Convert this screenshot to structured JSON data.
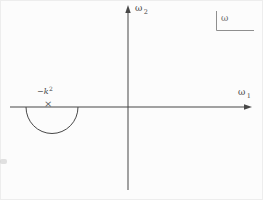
{
  "diagram": {
    "background_color": "#fcfcfc",
    "line_color": "#474747",
    "bracket_color": "#8f8f8f",
    "vertical_axis_label": {
      "symbol": "ω",
      "subscript": "2"
    },
    "horizontal_axis_label": {
      "symbol": "ω",
      "subscript": "1"
    },
    "plane_label": "ω",
    "pole": {
      "label_prefix": "−",
      "label_symbol": "k",
      "label_exponent": "2",
      "marker_symbol": "×"
    }
  }
}
